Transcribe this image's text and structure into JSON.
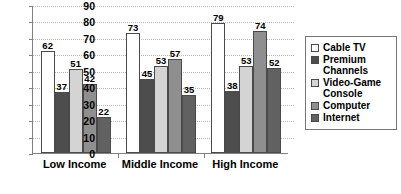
{
  "chart_data": {
    "type": "bar",
    "title": "",
    "subtitle": "",
    "xlabel": "",
    "ylabel": "",
    "ylim": [
      0,
      90
    ],
    "ytick_step": 10,
    "yticks": [
      "0",
      "10",
      "20",
      "30",
      "40",
      "50",
      "60",
      "70",
      "80",
      "90"
    ],
    "grid": true,
    "grid_style": "horizontal-dotted",
    "legend_position": "right",
    "categories": [
      "Low Income",
      "Middle Income",
      "High Income"
    ],
    "series": [
      {
        "name": "Cable TV",
        "color": "#ffffff",
        "values": [
          62,
          73,
          79
        ]
      },
      {
        "name": "Premium Channels",
        "color": "#4d4d4d",
        "values": [
          37,
          45,
          38
        ]
      },
      {
        "name": "Video-Game Console",
        "color": "#d4d4d4",
        "values": [
          51,
          53,
          53
        ]
      },
      {
        "name": "Computer",
        "color": "#8f8f8f",
        "values": [
          42,
          57,
          74
        ]
      },
      {
        "name": "Internet",
        "color": "#616161",
        "values": [
          22,
          35,
          52
        ]
      }
    ]
  },
  "colors": {
    "axis": "#808080",
    "gridline": "#b9b9b9",
    "bar_outline": "#4a4a4a",
    "legend_border": "#767676",
    "text": "#000000",
    "background": "#ffffff"
  }
}
